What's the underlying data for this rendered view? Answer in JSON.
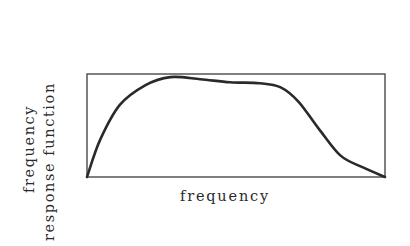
{
  "chart_data": {
    "type": "line",
    "title": "",
    "xlabel": "frequency",
    "ylabel_lines": [
      "frequency",
      "response function"
    ],
    "ylabel": "frequency response function",
    "xlim": [
      0,
      1
    ],
    "ylim": [
      0,
      1
    ],
    "grid": false,
    "legend": null,
    "ticks": {
      "x": [],
      "y": []
    },
    "series": [
      {
        "name": "frequency response",
        "x": [
          0,
          0.044,
          0.11,
          0.195,
          0.28,
          0.38,
          0.48,
          0.58,
          0.65,
          0.71,
          0.78,
          0.85,
          0.92,
          1.0
        ],
        "y": [
          0,
          0.36,
          0.7,
          0.89,
          0.97,
          0.95,
          0.92,
          0.91,
          0.87,
          0.73,
          0.46,
          0.21,
          0.1,
          0
        ]
      }
    ]
  },
  "colors": {
    "line": "#2a2a2a",
    "frame": "#555555"
  }
}
